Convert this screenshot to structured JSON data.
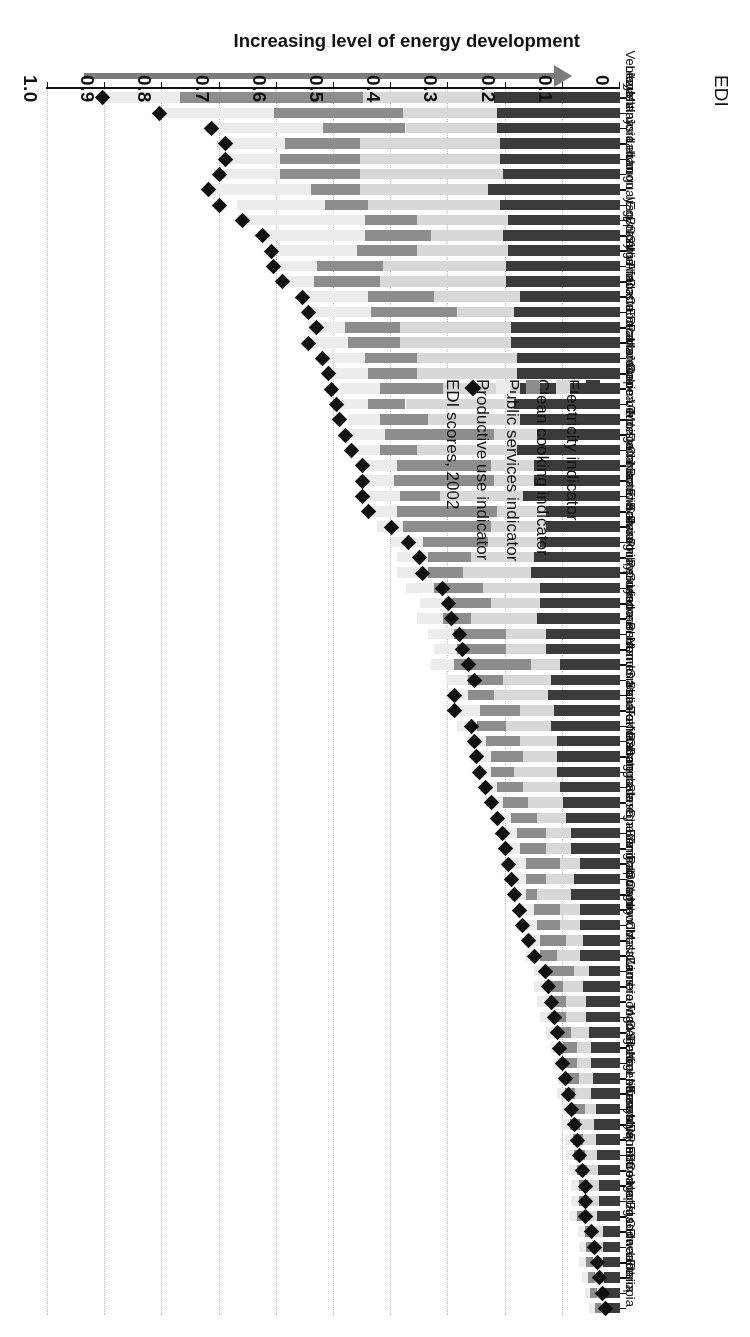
{
  "figure": {
    "headline": "Increasing level of energy development",
    "axis_title": "EDI",
    "arrow_label": "increasing-development-arrow"
  },
  "legend": {
    "position": "top-left",
    "items": [
      {
        "label": "Electricity indicator",
        "color": "#3b3b3b",
        "shape": "square"
      },
      {
        "label": "Clean cooking indicator",
        "color": "#d8d8d8",
        "shape": "square"
      },
      {
        "label": "Public services indicator",
        "color": "#8d8d8d",
        "shape": "square"
      },
      {
        "label": "Productive use indicator",
        "color": "#ececec",
        "shape": "square"
      },
      {
        "label": "EDI scores, 2002",
        "color": "#111111",
        "shape": "diamond"
      }
    ]
  },
  "chart_data": {
    "type": "bar",
    "orientation": "horizontal-stacked",
    "title": "Increasing level of energy development",
    "xlabel": "EDI",
    "ylabel": "",
    "xlim": [
      0,
      1.0
    ],
    "xticks": [
      "0",
      "0.1",
      "0.2",
      "0.3",
      "0.4",
      "0.5",
      "0.6",
      "0.7",
      "0.8",
      "0.9",
      "1.0"
    ],
    "grid": true,
    "legend_position": "top-left",
    "series": [
      {
        "name": "Electricity indicator",
        "color": "#3b3b3b"
      },
      {
        "name": "Clean cooking indicator",
        "color": "#d8d8d8"
      },
      {
        "name": "Public services indicator",
        "color": "#8d8d8d"
      },
      {
        "name": "Productive use indicator",
        "color": "#ececec"
      }
    ],
    "marker_series": {
      "name": "EDI scores, 2002",
      "color": "#111111",
      "shape": "diamond"
    },
    "categories": [
      "Libya",
      "Venezuela",
      "Argentina",
      "Malaysia",
      "Jordan",
      "Iran",
      "Lebanon",
      "Uruguay",
      "Iraq",
      "Egypt",
      "Brazil",
      "Syria",
      "Algeria",
      "South Africa",
      "Thailand",
      "Cuba",
      "Costa Rica",
      "Ecuador",
      "Panama",
      "Morocco",
      "Jamaica",
      "Colombia",
      "Cape Verde",
      "Tunisia",
      "Mongolia",
      "China",
      "Dominican",
      "Namibia",
      "Botswana",
      "Bolivia",
      "El Salvador",
      "Paraguay",
      "Peru",
      "Philippines",
      "Guyana",
      "Vietnam",
      "Indonesia",
      "Bhutan",
      "Yemen",
      "Honduras",
      "India",
      "Sri Lanka",
      "Sao Tome",
      "Pakistan",
      "Gabon",
      "Nicaragua",
      "Guatemala",
      "Bangladesh",
      "Senegal",
      "Ghana",
      "Benin",
      "Angola",
      "Zimbabwe",
      "Congo",
      "Papua New",
      "Cambodia",
      "Ivory Coast",
      "Malawi",
      "Laos",
      "Zambia",
      "Cameroon",
      "Togo",
      "CAR",
      "Haiti",
      "Madagascar",
      "Nigeria",
      "Sierra Leone",
      "Kenya",
      "Tanzania",
      "Mozambique",
      "Myanmar",
      "Eritrea",
      "DR of Congo",
      "Nepal",
      "Burkina Faso",
      "Uganda",
      "Guinea",
      "Rwanda",
      "Liberia",
      "Ethiopia"
    ],
    "stacks": [
      [
        0.22,
        0.23,
        0.32,
        0.14
      ],
      [
        0.215,
        0.165,
        0.225,
        0.205
      ],
      [
        0.215,
        0.16,
        0.145,
        0.205
      ],
      [
        0.21,
        0.245,
        0.13,
        0.12
      ],
      [
        0.21,
        0.245,
        0.14,
        0.095
      ],
      [
        0.205,
        0.25,
        0.14,
        0.1
      ],
      [
        0.23,
        0.225,
        0.085,
        0.18
      ],
      [
        0.21,
        0.23,
        0.075,
        0.155
      ],
      [
        0.195,
        0.16,
        0.09,
        0.225
      ],
      [
        0.205,
        0.125,
        0.115,
        0.185
      ],
      [
        0.195,
        0.16,
        0.105,
        0.14
      ],
      [
        0.2,
        0.215,
        0.115,
        0.075
      ],
      [
        0.2,
        0.22,
        0.115,
        0.06
      ],
      [
        0.175,
        0.15,
        0.115,
        0.12
      ],
      [
        0.185,
        0.1,
        0.15,
        0.115
      ],
      [
        0.19,
        0.195,
        0.095,
        0.065
      ],
      [
        0.19,
        0.195,
        0.09,
        0.065
      ],
      [
        0.18,
        0.175,
        0.09,
        0.075
      ],
      [
        0.18,
        0.175,
        0.085,
        0.075
      ],
      [
        0.175,
        0.135,
        0.11,
        0.07
      ],
      [
        0.185,
        0.19,
        0.065,
        0.055
      ],
      [
        0.175,
        0.16,
        0.085,
        0.055
      ],
      [
        0.145,
        0.075,
        0.19,
        0.065
      ],
      [
        0.18,
        0.175,
        0.065,
        0.055
      ],
      [
        0.15,
        0.075,
        0.165,
        0.065
      ],
      [
        0.15,
        0.07,
        0.175,
        0.055
      ],
      [
        0.17,
        0.145,
        0.07,
        0.055
      ],
      [
        0.13,
        0.085,
        0.175,
        0.045
      ],
      [
        0.13,
        0.095,
        0.155,
        0.045
      ],
      [
        0.14,
        0.09,
        0.115,
        0.055
      ],
      [
        0.15,
        0.11,
        0.075,
        0.055
      ],
      [
        0.155,
        0.12,
        0.06,
        0.055
      ],
      [
        0.14,
        0.1,
        0.085,
        0.05
      ],
      [
        0.14,
        0.085,
        0.08,
        0.045
      ],
      [
        0.145,
        0.115,
        0.05,
        0.045
      ],
      [
        0.13,
        0.07,
        0.09,
        0.045
      ],
      [
        0.13,
        0.07,
        0.085,
        0.04
      ],
      [
        0.105,
        0.05,
        0.135,
        0.04
      ],
      [
        0.12,
        0.085,
        0.06,
        0.04
      ],
      [
        0.125,
        0.095,
        0.045,
        0.04
      ],
      [
        0.115,
        0.06,
        0.07,
        0.04
      ],
      [
        0.12,
        0.08,
        0.05,
        0.035
      ],
      [
        0.11,
        0.065,
        0.06,
        0.035
      ],
      [
        0.11,
        0.06,
        0.055,
        0.035
      ],
      [
        0.11,
        0.075,
        0.04,
        0.03
      ],
      [
        0.105,
        0.065,
        0.045,
        0.03
      ],
      [
        0.1,
        0.06,
        0.045,
        0.03
      ],
      [
        0.095,
        0.05,
        0.045,
        0.03
      ],
      [
        0.085,
        0.045,
        0.05,
        0.03
      ],
      [
        0.085,
        0.045,
        0.045,
        0.03
      ],
      [
        0.07,
        0.035,
        0.06,
        0.025
      ],
      [
        0.08,
        0.05,
        0.035,
        0.025
      ],
      [
        0.085,
        0.06,
        0.02,
        0.025
      ],
      [
        0.07,
        0.035,
        0.045,
        0.025
      ],
      [
        0.07,
        0.035,
        0.04,
        0.025
      ],
      [
        0.065,
        0.03,
        0.045,
        0.025
      ],
      [
        0.07,
        0.04,
        0.03,
        0.025
      ],
      [
        0.055,
        0.025,
        0.05,
        0.02
      ],
      [
        0.065,
        0.035,
        0.03,
        0.02
      ],
      [
        0.06,
        0.035,
        0.03,
        0.02
      ],
      [
        0.06,
        0.035,
        0.025,
        0.02
      ],
      [
        0.055,
        0.03,
        0.025,
        0.02
      ],
      [
        0.05,
        0.025,
        0.025,
        0.02
      ],
      [
        0.05,
        0.025,
        0.025,
        0.015
      ],
      [
        0.048,
        0.024,
        0.022,
        0.015
      ],
      [
        0.05,
        0.028,
        0.018,
        0.015
      ],
      [
        0.042,
        0.02,
        0.024,
        0.015
      ],
      [
        0.045,
        0.025,
        0.018,
        0.015
      ],
      [
        0.042,
        0.022,
        0.018,
        0.014
      ],
      [
        0.04,
        0.022,
        0.018,
        0.014
      ],
      [
        0.038,
        0.02,
        0.018,
        0.014
      ],
      [
        0.036,
        0.02,
        0.016,
        0.013
      ],
      [
        0.036,
        0.022,
        0.014,
        0.013
      ],
      [
        0.04,
        0.026,
        0.01,
        0.012
      ],
      [
        0.03,
        0.016,
        0.016,
        0.012
      ],
      [
        0.03,
        0.016,
        0.014,
        0.012
      ],
      [
        0.03,
        0.018,
        0.012,
        0.011
      ],
      [
        0.028,
        0.016,
        0.012,
        0.011
      ],
      [
        0.026,
        0.014,
        0.012,
        0.01
      ],
      [
        0.022,
        0.012,
        0.01,
        0.01
      ]
    ],
    "edi_scores": [
      0.905,
      0.805,
      0.715,
      0.69,
      0.69,
      0.7,
      0.72,
      0.7,
      0.66,
      0.625,
      0.61,
      0.605,
      0.59,
      0.555,
      0.545,
      0.53,
      0.545,
      0.52,
      0.51,
      0.505,
      0.495,
      0.49,
      0.48,
      0.47,
      0.45,
      0.45,
      0.45,
      0.44,
      0.4,
      0.37,
      0.35,
      0.345,
      0.31,
      0.3,
      0.295,
      0.28,
      0.275,
      0.265,
      0.255,
      0.29,
      0.29,
      0.26,
      0.255,
      0.25,
      0.245,
      0.235,
      0.225,
      0.215,
      0.205,
      0.2,
      0.195,
      0.19,
      0.185,
      0.175,
      0.17,
      0.16,
      0.15,
      0.13,
      0.125,
      0.12,
      0.115,
      0.11,
      0.105,
      0.1,
      0.095,
      0.09,
      0.085,
      0.08,
      0.075,
      0.07,
      0.065,
      0.06,
      0.06,
      0.06,
      0.05,
      0.045,
      0.04,
      0.035,
      0.03,
      0.025
    ]
  }
}
